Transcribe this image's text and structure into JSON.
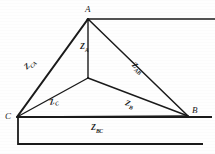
{
  "figure": {
    "background_color": "#fefefe",
    "ink_color": "#1a1a1a",
    "vertices": [
      {
        "name": "A",
        "label": "A",
        "x": 88,
        "y": 19
      },
      {
        "name": "B",
        "label": "B",
        "x": 188,
        "y": 116
      },
      {
        "name": "C",
        "label": "C",
        "x": 17,
        "y": 117
      },
      {
        "name": "N",
        "label": "",
        "x": 88,
        "y": 78
      }
    ],
    "delta_impedances": [
      {
        "name": "Z_CA",
        "base": "Z",
        "sub": "CA",
        "x": 30,
        "y": 66
      },
      {
        "name": "Z_AB",
        "base": "Z",
        "sub": "AB",
        "x": 134,
        "y": 63
      },
      {
        "name": "Z_BC",
        "base": "Z",
        "sub": "BC",
        "x": 93,
        "y": 126
      }
    ],
    "wye_impedances": [
      {
        "name": "Z_A",
        "base": "Z",
        "sub": "A",
        "x": 84,
        "y": 46
      },
      {
        "name": "Z_B",
        "base": "Z",
        "sub": "B",
        "x": 128,
        "y": 101
      },
      {
        "name": "Z_C",
        "base": "Z",
        "sub": "C",
        "x": 52,
        "y": 100
      }
    ],
    "conductors": {
      "top_lead_label": "lead-from-A-to-right-edge",
      "baseline_label": "baseline-C-to-right-edge",
      "return_line_label": "lower-return-conductor",
      "left_riser_label": "left-vertical-riser"
    }
  }
}
